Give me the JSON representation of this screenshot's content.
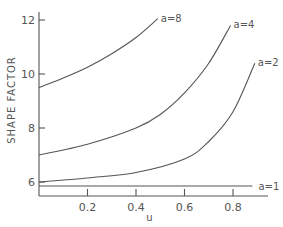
{
  "chart_data": {
    "type": "line",
    "title": "",
    "xlabel": "u",
    "ylabel": "SHAPE FACTOR",
    "xlim": [
      0,
      0.95
    ],
    "ylim": [
      5.4,
      12.6
    ],
    "grid": false,
    "legend": "inline curve labels at curve ends",
    "x_ticks": [
      0.2,
      0.4,
      0.6,
      0.8
    ],
    "x_tick_labels": [
      "0.2",
      "0.4",
      "0.6",
      "0.8"
    ],
    "y_ticks": [
      6,
      8,
      10,
      12
    ],
    "y_tick_labels": [
      "6",
      "8",
      "10",
      "12"
    ],
    "series": [
      {
        "name": "a=8",
        "x": [
          0,
          0.1,
          0.2,
          0.3,
          0.4,
          0.49
        ],
        "values": [
          9.5,
          9.85,
          10.25,
          10.75,
          11.35,
          12.05
        ]
      },
      {
        "name": "a=4",
        "x": [
          0,
          0.2,
          0.4,
          0.5,
          0.6,
          0.7,
          0.79
        ],
        "values": [
          7.0,
          7.4,
          8.0,
          8.5,
          9.3,
          10.4,
          11.8
        ]
      },
      {
        "name": "a=2",
        "x": [
          0,
          0.2,
          0.4,
          0.6,
          0.7,
          0.8,
          0.89
        ],
        "values": [
          6.0,
          6.15,
          6.35,
          6.85,
          7.5,
          8.6,
          10.4
        ]
      },
      {
        "name": "a=1",
        "x": [
          0,
          0.88
        ],
        "values": [
          5.85,
          5.85
        ]
      }
    ]
  }
}
